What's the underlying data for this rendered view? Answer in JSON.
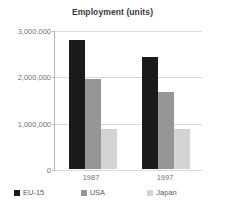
{
  "chart_data": {
    "type": "bar",
    "title": "Employment (units)",
    "xlabel": "",
    "ylabel": "",
    "categories": [
      "1987",
      "1997"
    ],
    "series": [
      {
        "name": "EU-15",
        "color": "#1a1a1a",
        "values": [
          2800000,
          2440000
        ]
      },
      {
        "name": "USA",
        "color": "#969696",
        "values": [
          1960000,
          1680000
        ]
      },
      {
        "name": "Japan",
        "color": "#d4d4d4",
        "values": [
          880000,
          870000
        ]
      }
    ],
    "ylim": [
      0,
      3000000
    ],
    "yticks": [
      0,
      1000000,
      2000000,
      3000000
    ],
    "ytick_labels": [
      "0",
      "1,000,000",
      "2,000,000",
      "3,000,000"
    ],
    "grid": true,
    "legend_position": "bottom"
  }
}
